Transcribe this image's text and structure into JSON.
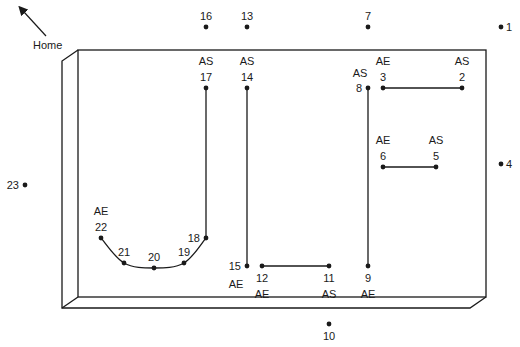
{
  "diagram": {
    "home_label": "Home",
    "colors": {
      "line": "#1a1a1a",
      "background": "#ffffff"
    },
    "workpiece": {
      "front": {
        "x1": 78,
        "y1": 50,
        "x2": 486,
        "y2": 297
      },
      "bevel_offset": {
        "dx": -16,
        "dy": 11
      }
    },
    "points": [
      {
        "id": "1",
        "x": 501,
        "y": 27,
        "label": "1",
        "label_pos": "right"
      },
      {
        "id": "2",
        "x": 462,
        "y": 88,
        "label": "2",
        "label_pos": "top",
        "tag": "AS"
      },
      {
        "id": "3",
        "x": 383,
        "y": 88,
        "label": "3",
        "label_pos": "top",
        "tag": "AE"
      },
      {
        "id": "4",
        "x": 501,
        "y": 164,
        "label": "4",
        "label_pos": "right"
      },
      {
        "id": "5",
        "x": 436,
        "y": 167,
        "label": "5",
        "label_pos": "top",
        "tag": "AS"
      },
      {
        "id": "6",
        "x": 383,
        "y": 167,
        "label": "6",
        "label_pos": "top",
        "tag": "AE"
      },
      {
        "id": "7",
        "x": 368,
        "y": 27,
        "label": "7",
        "label_pos": "top"
      },
      {
        "id": "8",
        "x": 368,
        "y": 88,
        "label": "8",
        "label_pos": "left",
        "tag": "AS"
      },
      {
        "id": "9",
        "x": 368,
        "y": 266,
        "label": "9",
        "label_pos": "bottom",
        "tag": "AE"
      },
      {
        "id": "10",
        "x": 329,
        "y": 324,
        "label": "10",
        "label_pos": "bottom"
      },
      {
        "id": "11",
        "x": 329,
        "y": 266,
        "label": "11",
        "label_pos": "bottom",
        "tag": "AS"
      },
      {
        "id": "12",
        "x": 262,
        "y": 266,
        "label": "12",
        "label_pos": "bottom",
        "tag": "AE"
      },
      {
        "id": "13",
        "x": 247,
        "y": 27,
        "label": "13",
        "label_pos": "top"
      },
      {
        "id": "14",
        "x": 247,
        "y": 88,
        "label": "14",
        "label_pos": "top",
        "tag": "AS"
      },
      {
        "id": "15",
        "x": 247,
        "y": 266,
        "label": "15",
        "label_pos": "left",
        "tag": "AE"
      },
      {
        "id": "16",
        "x": 206,
        "y": 27,
        "label": "16",
        "label_pos": "top"
      },
      {
        "id": "17",
        "x": 206,
        "y": 88,
        "label": "17",
        "label_pos": "top",
        "tag": "AS"
      },
      {
        "id": "18",
        "x": 206,
        "y": 238,
        "label": "18",
        "label_pos": "left"
      },
      {
        "id": "19",
        "x": 184,
        "y": 263,
        "label": "19",
        "label_pos": "top"
      },
      {
        "id": "20",
        "x": 154,
        "y": 268,
        "label": "20",
        "label_pos": "top"
      },
      {
        "id": "21",
        "x": 124,
        "y": 263,
        "label": "21",
        "label_pos": "top"
      },
      {
        "id": "22",
        "x": 101,
        "y": 238,
        "label": "22",
        "label_pos": "top",
        "tag": "AE"
      },
      {
        "id": "23",
        "x": 25,
        "y": 185,
        "label": "23",
        "label_pos": "left"
      }
    ],
    "paths": [
      {
        "name": "cut-2-3",
        "type": "line",
        "from": "2",
        "to": "3"
      },
      {
        "name": "cut-5-6",
        "type": "line",
        "from": "5",
        "to": "6"
      },
      {
        "name": "cut-8-9",
        "type": "line",
        "from": "8",
        "to": "9"
      },
      {
        "name": "cut-11-12",
        "type": "line",
        "from": "11",
        "to": "12"
      },
      {
        "name": "cut-14-15",
        "type": "line",
        "from": "14",
        "to": "15"
      },
      {
        "name": "cut-17-18",
        "type": "line",
        "from": "17",
        "to": "18"
      },
      {
        "name": "arc-18-22",
        "type": "arc",
        "from": "18",
        "to": "22",
        "through": [
          "19",
          "20",
          "21"
        ]
      }
    ]
  }
}
